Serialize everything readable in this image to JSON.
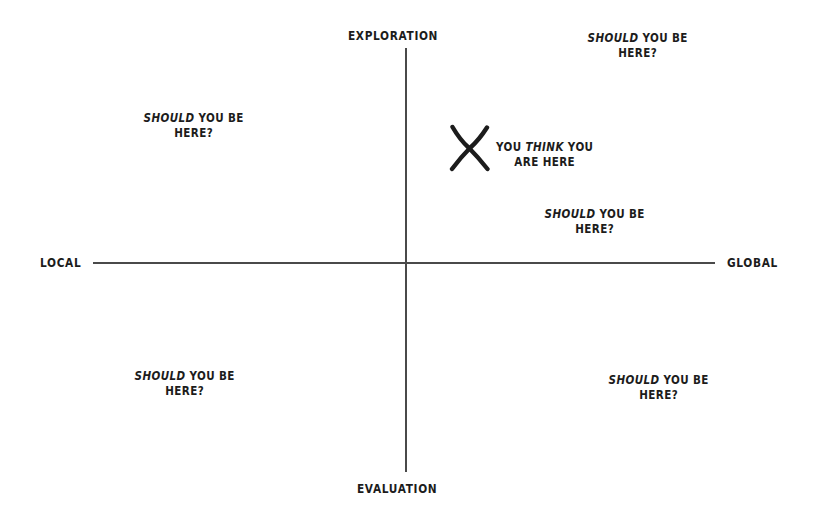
{
  "diagram": {
    "type": "2x2-quadrant-matrix",
    "background_color": "#ffffff",
    "ink_color": "#1c1c1c",
    "axis_color": "#4a4a4a",
    "axes": {
      "vertical": {
        "top_label": "EXPLORATION",
        "bottom_label": "EVALUATION"
      },
      "horizontal": {
        "left_label": "LOCAL",
        "right_label": "GLOBAL"
      }
    },
    "marker": {
      "glyph": "X",
      "callout": {
        "line1_pre": "YOU ",
        "line1_em": "THINK",
        "line1_post": " YOU",
        "line2": "ARE HERE"
      }
    },
    "prompts": {
      "em": "SHOULD",
      "rest_line1": " YOU BE",
      "line2": "HERE?"
    },
    "prompt_positions": [
      "top-left",
      "top-right",
      "mid-right",
      "bottom-left",
      "bottom-right"
    ]
  }
}
